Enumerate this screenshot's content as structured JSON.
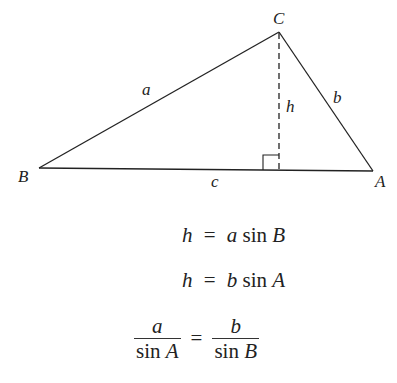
{
  "diagram": {
    "type": "triangle-law-of-sines",
    "vertices": {
      "B": {
        "label": "B",
        "x": 39,
        "y": 168
      },
      "C": {
        "label": "C",
        "x": 279,
        "y": 32
      },
      "A": {
        "label": "A",
        "x": 373,
        "y": 171
      }
    },
    "sides": {
      "a": "a",
      "b": "b",
      "c": "c"
    },
    "altitude": {
      "label": "h",
      "style": "dashed",
      "right_angle_marker": true
    },
    "colors": {
      "line": "#222222",
      "background": "#ffffff"
    }
  },
  "equations": {
    "line1": {
      "lhs": "h",
      "eq": "=",
      "coef": "a",
      "fn": "sin",
      "arg": "B"
    },
    "line2": {
      "lhs": "h",
      "eq": "=",
      "coef": "b",
      "fn": "sin",
      "arg": "A"
    },
    "line3": {
      "left": {
        "num": "a",
        "den_fn": "sin",
        "den_arg": "A"
      },
      "eq": "=",
      "right": {
        "num": "b",
        "den_fn": "sin",
        "den_arg": "B"
      }
    }
  }
}
